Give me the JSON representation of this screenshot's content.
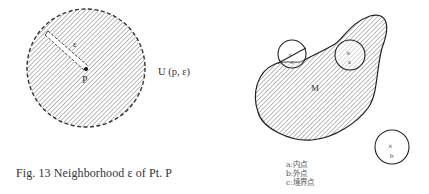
{
  "figure": {
    "caption": "Fig. 13  Neighborhood ε of Pt. P",
    "left_diagram": {
      "center_label": "P",
      "radius_label": "ε",
      "set_label": "U (p, ε)"
    },
    "right_diagram": {
      "region_label": "M",
      "points": [
        {
          "id": "a",
          "label": "a",
          "kind": "interior"
        },
        {
          "id": "b",
          "label": "b",
          "kind": "exterior"
        },
        {
          "id": "c",
          "label": "c",
          "kind": "boundary"
        }
      ]
    },
    "legend": [
      {
        "key": "a",
        "sep": ":",
        "text": "内点"
      },
      {
        "key": "b",
        "sep": ":",
        "text": "外点"
      },
      {
        "key": "c",
        "sep": ":",
        "text": "境界点"
      }
    ]
  }
}
